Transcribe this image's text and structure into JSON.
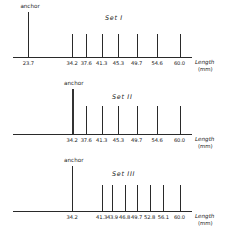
{
  "figure": {
    "background": "#ffffff",
    "ink": "#2a2a2a",
    "axis_name": "Length",
    "axis_unit": "(mm)",
    "anchor_label": "anchor"
  },
  "chart_data": {
    "type": "bar",
    "title": "",
    "xlabel": "Length (mm)",
    "ylabel": "",
    "xlim": [
      20.0,
      63.0
    ],
    "grid": false,
    "legend": "none",
    "note": "Three one-dimensional line-spectrum (ladder) diagrams; each vertical line marks a fragment length in mm along a horizontal Length axis. The tallest line in each panel is the labelled 'anchor'.",
    "panels": [
      {
        "id": "set-1",
        "title": "Set I",
        "anchor": {
          "label": "anchor",
          "value": "23.7",
          "x": 23.7,
          "height": 1.0,
          "style": "tall"
        },
        "categories": [
          "23.7",
          "34.2",
          "37.6",
          "41.3",
          "45.3",
          "49.7",
          "54.6",
          "60.0"
        ],
        "values": [
          1.0,
          0.52,
          0.52,
          0.52,
          0.52,
          0.52,
          0.52,
          0.52
        ],
        "ticks": [
          {
            "label": "23.7",
            "x": 23.7,
            "height": 1.0,
            "anchor": true
          },
          {
            "label": "34.2",
            "x": 34.2,
            "height": 0.52,
            "anchor": false
          },
          {
            "label": "37.6",
            "x": 37.6,
            "height": 0.52,
            "anchor": false
          },
          {
            "label": "41.3",
            "x": 41.3,
            "height": 0.52,
            "anchor": false
          },
          {
            "label": "45.3",
            "x": 45.3,
            "height": 0.52,
            "anchor": false
          },
          {
            "label": "49.7",
            "x": 49.7,
            "height": 0.52,
            "anchor": false
          },
          {
            "label": "54.6",
            "x": 54.6,
            "height": 0.52,
            "anchor": false
          },
          {
            "label": "60.0",
            "x": 60.0,
            "height": 0.52,
            "anchor": false
          }
        ]
      },
      {
        "id": "set-2",
        "title": "Set II",
        "anchor": {
          "label": "anchor",
          "value": "34.2",
          "x": 34.2,
          "height": 1.0,
          "style": "thick"
        },
        "categories": [
          "34.2",
          "37.6",
          "41.3",
          "45.3",
          "49.7",
          "54.6",
          "60.0"
        ],
        "values": [
          1.0,
          0.62,
          0.62,
          0.62,
          0.62,
          0.62,
          0.62
        ],
        "ticks": [
          {
            "label": "34.2",
            "x": 34.2,
            "height": 1.0,
            "anchor": true
          },
          {
            "label": "37.6",
            "x": 37.6,
            "height": 0.62,
            "anchor": false
          },
          {
            "label": "41.3",
            "x": 41.3,
            "height": 0.62,
            "anchor": false
          },
          {
            "label": "45.3",
            "x": 45.3,
            "height": 0.62,
            "anchor": false
          },
          {
            "label": "49.7",
            "x": 49.7,
            "height": 0.62,
            "anchor": false
          },
          {
            "label": "54.6",
            "x": 54.6,
            "height": 0.62,
            "anchor": false
          },
          {
            "label": "60.0",
            "x": 60.0,
            "height": 0.62,
            "anchor": false
          }
        ]
      },
      {
        "id": "set-3",
        "title": "Set III",
        "anchor": {
          "label": "anchor",
          "value": "34.2",
          "x": 34.2,
          "height": 1.0,
          "style": "tall"
        },
        "categories": [
          "34.2",
          "41.3",
          "43.9",
          "46.8",
          "49.7",
          "52.8",
          "56.1",
          "60.0"
        ],
        "values": [
          1.0,
          0.58,
          0.58,
          0.58,
          0.58,
          0.58,
          0.58,
          0.58
        ],
        "ticks": [
          {
            "label": "34.2",
            "x": 34.2,
            "height": 1.0,
            "anchor": true
          },
          {
            "label": "41.3",
            "x": 41.3,
            "height": 0.58,
            "anchor": false
          },
          {
            "label": "43.9",
            "x": 43.9,
            "height": 0.58,
            "anchor": false
          },
          {
            "label": "46.8",
            "x": 46.8,
            "height": 0.58,
            "anchor": false
          },
          {
            "label": "49.7",
            "x": 49.7,
            "height": 0.58,
            "anchor": false
          },
          {
            "label": "52.8",
            "x": 52.8,
            "height": 0.58,
            "anchor": false
          },
          {
            "label": "56.1",
            "x": 56.1,
            "height": 0.58,
            "anchor": false
          },
          {
            "label": "60.0",
            "x": 60.0,
            "height": 0.58,
            "anchor": false
          }
        ]
      }
    ]
  }
}
